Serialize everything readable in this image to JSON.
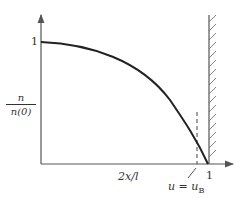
{
  "figure": {
    "y_axis_label_numerator": "n",
    "y_axis_label_denominator": "n(0)",
    "y_tick_label": "1",
    "x_axis_label": "2x/l",
    "x_tick_label": "1",
    "annotation": "u = u",
    "annotation_subscript": "B",
    "colors": {
      "axis": "#555555",
      "curve": "#222222",
      "wall": "#555555",
      "dashed": "#444444"
    }
  },
  "diagram": {
    "elements": [
      {
        "type": "axis",
        "name": "y-axis",
        "label": "n/n(0)",
        "tick": "1"
      },
      {
        "type": "axis",
        "name": "x-axis",
        "label": "2x/l",
        "tick": "1"
      },
      {
        "type": "curve",
        "name": "density-profile",
        "from": [
          0,
          1
        ],
        "to": [
          1,
          0
        ],
        "shape": "concave-down decreasing"
      },
      {
        "type": "vertical-dashed-line",
        "name": "u-equals-uB-marker",
        "label": "u = u_B",
        "position_x": 0.93
      },
      {
        "type": "hatched-wall",
        "name": "wall",
        "position_x": 1
      }
    ]
  }
}
